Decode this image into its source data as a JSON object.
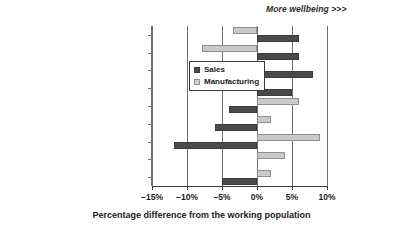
{
  "chart_data": {
    "type": "bar",
    "orientation": "horizontal",
    "title": "",
    "xlabel": "Percentage difference from the working population",
    "ylabel": "",
    "xlim": [
      -15,
      10
    ],
    "xticks": [
      -15,
      -10,
      -5,
      0,
      5,
      10
    ],
    "xtick_labels": [
      "−15%",
      "−10%",
      "−5%",
      "0%",
      "5%",
      "10%"
    ],
    "grid": true,
    "grid_axis": "x",
    "legend_position": "center-left inside plot",
    "annotation": "More wellbeing >>>",
    "categories": [
      "Job satisfaction",
      "Organisational satisfaction",
      "Organisational security",
      "Organisational commitment",
      "State of mind",
      "Resilience",
      "Confidence level",
      "Physical symptoms",
      "Energy level"
    ],
    "series": [
      {
        "name": "Sales",
        "color": "#4a4a4a",
        "values": [
          6.0,
          6.0,
          8.0,
          5.0,
          -4.0,
          -6.0,
          -11.8,
          0.0,
          -5.0
        ]
      },
      {
        "name": "Manufacturing",
        "color": "#c9c9c9",
        "values": [
          -3.5,
          -7.8,
          0.0,
          -3.5,
          6.0,
          2.0,
          9.0,
          4.0,
          2.0
        ]
      }
    ]
  },
  "legend": {
    "items": [
      {
        "label": "Sales"
      },
      {
        "label": "Manufacturing"
      }
    ]
  }
}
